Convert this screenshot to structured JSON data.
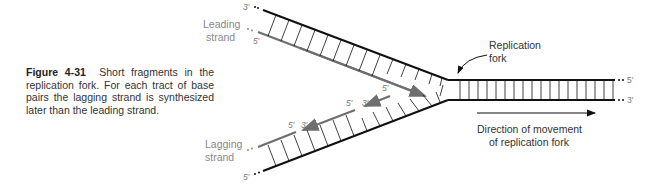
{
  "caption": {
    "figure_label": "Figure 4-31",
    "text": "Short fragments in the replication fork. For each tract of base pairs the lagging strand is synthesized later than the leading strand."
  },
  "labels": {
    "leading_strand_line1": "Leading",
    "leading_strand_line2": "strand",
    "lagging_strand_line1": "Lagging",
    "lagging_strand_line2": "strand",
    "replication_fork_line1": "Replication",
    "replication_fork_line2": "fork",
    "direction_line1": "Direction of movement",
    "direction_line2": "of replication fork"
  },
  "end_labels": {
    "top_parent_left": "3′",
    "leading_new_left": "5′",
    "parent_right_top": "5′",
    "parent_right_bottom": "3′",
    "lagging_parent_left": "5′",
    "fragment1_5": "5′",
    "fragment1_3": "3′",
    "fragment2_5": "5′",
    "fragment2_3": "3′",
    "fragment3_5": "5′"
  },
  "colors": {
    "parent_strand": "#111111",
    "new_strand": "#6e6e6e",
    "label_gray": "#888888",
    "text": "#333333"
  }
}
